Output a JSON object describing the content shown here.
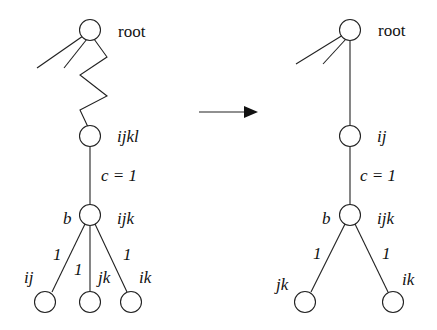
{
  "diagram": {
    "type": "tree-transformation",
    "left_tree": {
      "root": {
        "label": "root"
      },
      "chain_node": {
        "label": "ijkl"
      },
      "edge_label": "c = 1",
      "branch_node": {
        "left_label": "b",
        "right_label": "ijk"
      },
      "children": [
        {
          "label": "ij",
          "edge": "1"
        },
        {
          "label": "jk",
          "edge": "1"
        },
        {
          "label": "ik",
          "edge": "1"
        }
      ]
    },
    "arrow": {
      "direction": "right"
    },
    "right_tree": {
      "root": {
        "label": "root"
      },
      "chain_node": {
        "label": "ij"
      },
      "edge_label": "c = 1",
      "branch_node": {
        "left_label": "b",
        "right_label": "ijk"
      },
      "children": [
        {
          "label": "jk",
          "edge": "1"
        },
        {
          "label": "ik",
          "edge": "1"
        }
      ]
    }
  }
}
